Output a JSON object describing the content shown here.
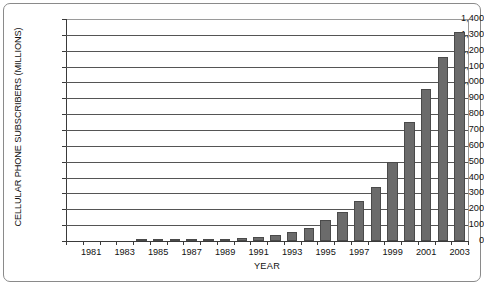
{
  "chart_data": {
    "type": "bar",
    "title": "",
    "xlabel": "YEAR",
    "ylabel": "CELLULAR PHONE SUBSCRIBERS (MILLIONS)",
    "ylim": [
      0,
      1400
    ],
    "ytick_labels": [
      "1,400",
      "1,300",
      "1,200",
      "1,100",
      "1,000",
      "900",
      "800",
      "700",
      "600",
      "500",
      "400",
      "300",
      "200",
      "100",
      "0"
    ],
    "ytick_values": [
      1400,
      1300,
      1200,
      1100,
      1000,
      900,
      800,
      700,
      600,
      500,
      400,
      300,
      200,
      100,
      0
    ],
    "grid": true,
    "legend": "none",
    "bar_color": "#6b6b6b",
    "bar_edge_color": "#4a4a4a",
    "categories": [
      1980,
      1981,
      1982,
      1983,
      1984,
      1985,
      1986,
      1987,
      1988,
      1989,
      1990,
      1991,
      1992,
      1993,
      1994,
      1995,
      1996,
      1997,
      1998,
      1999,
      2000,
      2001,
      2002,
      2003
    ],
    "xtick_labels": [
      "1981",
      "1983",
      "1985",
      "1987",
      "1989",
      "1991",
      "1993",
      "1995",
      "1997",
      "1999",
      "2001",
      "2003"
    ],
    "values": [
      0,
      0,
      0,
      0,
      1,
      2,
      3,
      5,
      8,
      12,
      20,
      28,
      40,
      60,
      85,
      130,
      180,
      250,
      340,
      500,
      750,
      960,
      1160,
      1320
    ]
  }
}
